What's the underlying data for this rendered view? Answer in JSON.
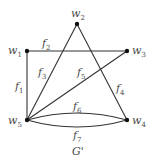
{
  "diagram": {
    "caption": "G'",
    "colors": {
      "edge": "#333333",
      "node": "#111111",
      "text": "#4a4a4a"
    },
    "nodes": [
      {
        "id": "w1",
        "label": "w",
        "sub": "1",
        "x": 27,
        "y": 51
      },
      {
        "id": "w2",
        "label": "w",
        "sub": "2",
        "x": 77,
        "y": 24
      },
      {
        "id": "w3",
        "label": "w",
        "sub": "3",
        "x": 127,
        "y": 51
      },
      {
        "id": "w4",
        "label": "w",
        "sub": "4",
        "x": 127,
        "y": 120
      },
      {
        "id": "w5",
        "label": "w",
        "sub": "5",
        "x": 27,
        "y": 120
      }
    ],
    "edges": [
      {
        "id": "f1",
        "label": "f",
        "sub": "1",
        "from": "w1",
        "to": "w5"
      },
      {
        "id": "f2",
        "label": "f",
        "sub": "2",
        "from": "w1",
        "to": "w3"
      },
      {
        "id": "f3",
        "label": "f",
        "sub": "3",
        "from": "w5",
        "to": "w2"
      },
      {
        "id": "f4",
        "label": "f",
        "sub": "4",
        "from": "w2",
        "to": "w4"
      },
      {
        "id": "f5",
        "label": "f",
        "sub": "5",
        "from": "w5",
        "to": "w3"
      },
      {
        "id": "f6",
        "label": "f",
        "sub": "6",
        "from": "w5",
        "to": "w4",
        "curve": "upper"
      },
      {
        "id": "f7",
        "label": "f",
        "sub": "7",
        "from": "w5",
        "to": "w4",
        "curve": "lower"
      }
    ]
  }
}
